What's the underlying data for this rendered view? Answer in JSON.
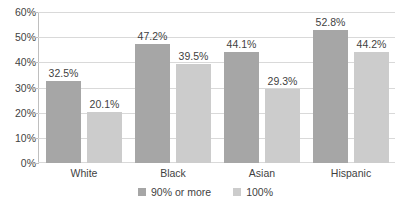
{
  "chart_data": {
    "type": "bar",
    "title": "",
    "subtitle": "",
    "xlabel": "",
    "ylabel": "",
    "categories": [
      "White",
      "Black",
      "Asian",
      "Hispanic"
    ],
    "series": [
      {
        "name": "90% or more",
        "color": "#A6A6A6",
        "values": [
          32.5,
          47.2,
          44.1,
          52.8
        ],
        "labels": [
          "32.5%",
          "47.2%",
          "44.1%",
          "52.8%"
        ]
      },
      {
        "name": "100%",
        "color": "#CCCCCC",
        "values": [
          20.1,
          39.5,
          29.3,
          44.2
        ],
        "labels": [
          "20.1%",
          "39.5%",
          "29.3%",
          "44.2%"
        ]
      }
    ],
    "ylim": [
      0,
      60
    ],
    "ytick_values": [
      0,
      10,
      20,
      30,
      40,
      50,
      60
    ],
    "ytick_labels": [
      "0%",
      "10%",
      "20%",
      "30%",
      "40%",
      "50%",
      "60%"
    ],
    "grid": true,
    "grid_axis": "y",
    "legend_position": "bottom",
    "value_labels_shown": true
  },
  "legend": {
    "items": [
      {
        "label": "90% or more",
        "swatch": "legend-swatch-90-or-more"
      },
      {
        "label": "100%",
        "swatch": "legend-swatch-100"
      }
    ]
  }
}
